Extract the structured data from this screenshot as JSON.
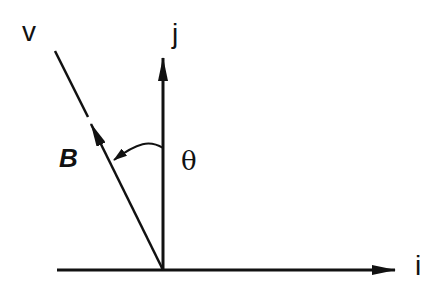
{
  "diagram": {
    "type": "vector-diagram",
    "labels": {
      "v": "v",
      "j": "j",
      "i": "i",
      "B": "B",
      "theta": "θ"
    },
    "vectors": [
      {
        "name": "i",
        "from": [
          57,
          270
        ],
        "to": [
          395,
          270
        ]
      },
      {
        "name": "j",
        "from": [
          163,
          270
        ],
        "to": [
          163,
          58
        ]
      },
      {
        "name": "B",
        "from": [
          163,
          270
        ],
        "to": [
          91,
          124
        ]
      },
      {
        "name": "v-line",
        "from": [
          88,
          117
        ],
        "to": [
          55,
          51
        ]
      }
    ],
    "angle": {
      "label": "θ",
      "between": [
        "j",
        "B"
      ]
    },
    "colors": {
      "stroke": "#111111",
      "background": "#ffffff"
    }
  }
}
